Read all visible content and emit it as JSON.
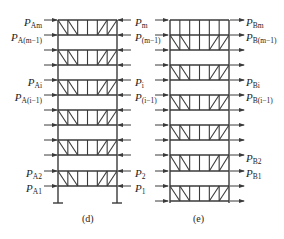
{
  "figure": {
    "colors": {
      "line": "#3a3a3a",
      "text": "#222222",
      "background": "#ffffff"
    },
    "panels": [
      {
        "id": "d",
        "caption": "(d)",
        "left_labels": [
          {
            "p": "P",
            "sub": "Am",
            "y": 22
          },
          {
            "p": "P",
            "sub": "A(m−1)",
            "y": 37
          },
          {
            "p": "P",
            "sub": "Ai",
            "y": 82
          },
          {
            "p": "P",
            "sub": "A(i−1)",
            "y": 97
          },
          {
            "p": "P",
            "sub": "A2",
            "y": 173
          },
          {
            "p": "P",
            "sub": "A1",
            "y": 188
          }
        ]
      },
      {
        "id": "mid",
        "labels": [
          {
            "p": "P",
            "sub": "m",
            "y": 22
          },
          {
            "p": "P",
            "sub": "(m−1)",
            "y": 37
          },
          {
            "p": "P",
            "sub": "i",
            "y": 82
          },
          {
            "p": "P",
            "sub": "(i−1)",
            "y": 97
          },
          {
            "p": "P",
            "sub": "2",
            "y": 173
          },
          {
            "p": "P",
            "sub": "1",
            "y": 188
          }
        ]
      },
      {
        "id": "e",
        "caption": "(e)",
        "right_labels": [
          {
            "p": "P",
            "sub": "Bm",
            "y": 22
          },
          {
            "p": "P",
            "sub": "B(m−1)",
            "y": 37
          },
          {
            "p": "P",
            "sub": "Bi",
            "y": 82
          },
          {
            "p": "P",
            "sub": "B(i−1)",
            "y": 97
          },
          {
            "p": "P",
            "sub": "B2",
            "y": 158
          },
          {
            "p": "P",
            "sub": "B1",
            "y": 173
          }
        ]
      }
    ]
  }
}
